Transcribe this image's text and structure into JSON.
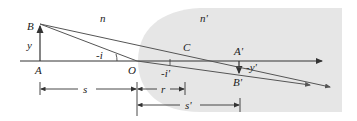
{
  "diagram": {
    "medium_labels": {
      "left": "n",
      "right": "n'"
    },
    "points": {
      "object_top": "B",
      "object_base": "A",
      "vertex": "O",
      "center": "C",
      "image_base": "A'",
      "image_top": "B'"
    },
    "heights": {
      "object": "y",
      "image": "-y'"
    },
    "angles": {
      "incidence": "-i",
      "refraction": "-i'"
    },
    "distances": {
      "object": "s",
      "radius": "r",
      "image": "s'"
    },
    "colors": {
      "region": "#e6e6e6",
      "lines": "#333333",
      "rays": "#555555"
    }
  }
}
